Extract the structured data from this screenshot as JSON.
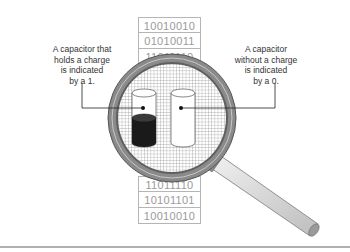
{
  "diagram": {
    "callouts": {
      "left": "A capacitor that\nholds a charge\nis indicated\nby a 1.",
      "right": "A capacitor\nwithout a charge\nis indicated\nby a 0."
    },
    "bit_strings_top": [
      "10010010",
      "01010011",
      "11011110"
    ],
    "bit_strings_bottom": [
      "11011110",
      "10101101",
      "10010010"
    ],
    "capacitors": [
      {
        "name": "charged",
        "bit": "1",
        "fill_fraction": 0.5
      },
      {
        "name": "uncharged",
        "bit": "0",
        "fill_fraction": 0
      }
    ],
    "colors": {
      "lens_frame": "#7d7d7d",
      "grid": "#9a9a9a",
      "charge": "#1a1a1a",
      "handle": "#d4d4d4"
    }
  }
}
